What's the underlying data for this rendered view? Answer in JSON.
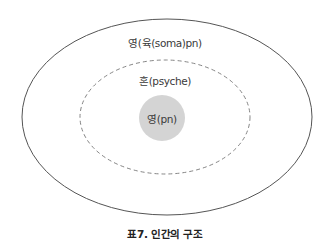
{
  "diagram": {
    "layers": [
      {
        "id": "outer",
        "label": "영(육(soma)pn)",
        "style": "solid"
      },
      {
        "id": "middle",
        "label": "혼(psyche)",
        "style": "dashed"
      },
      {
        "id": "inner",
        "label": "영(pn)",
        "style": "filled",
        "fill": "#d4d4d4"
      }
    ],
    "caption": "표7. 인간의 구조"
  },
  "colors": {
    "outline": "#555555",
    "dashed_outline": "#777777",
    "inner_fill": "#d4d4d4"
  }
}
